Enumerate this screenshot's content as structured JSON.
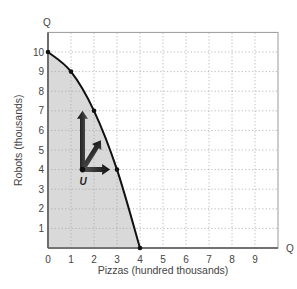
{
  "chart_data": {
    "type": "line",
    "title": "",
    "xlabel": "Pizzas (hundred thousands)",
    "ylabel": "Robots (thousands)",
    "x_axis_end_label": "Q",
    "y_axis_end_label": "Q",
    "xlim": [
      0,
      10
    ],
    "ylim": [
      0,
      11
    ],
    "x_ticks": [
      "0",
      "1",
      "2",
      "3",
      "4",
      "5",
      "6",
      "7",
      "8",
      "9"
    ],
    "y_ticks": [
      "1",
      "2",
      "3",
      "4",
      "5",
      "6",
      "7",
      "8",
      "9",
      "10"
    ],
    "grid": "dotted",
    "series": [
      {
        "name": "Production possibilities frontier",
        "x": [
          0,
          1,
          2,
          3,
          4
        ],
        "y": [
          10,
          9,
          7,
          4,
          0
        ],
        "fill_below": true,
        "fill_color": "#d9d9d9",
        "line_color": "#111111"
      }
    ],
    "points": [
      {
        "label": "U",
        "x": 1.5,
        "y": 4
      }
    ],
    "annotations": [
      {
        "type": "arrow",
        "from": [
          1.5,
          4
        ],
        "to": [
          1.5,
          7
        ],
        "direction": "up"
      },
      {
        "type": "arrow",
        "from": [
          1.5,
          4
        ],
        "to": [
          2.3,
          5.5
        ],
        "direction": "diagonal"
      },
      {
        "type": "arrow",
        "from": [
          1.5,
          4
        ],
        "to": [
          2.7,
          4
        ],
        "direction": "right"
      }
    ]
  }
}
